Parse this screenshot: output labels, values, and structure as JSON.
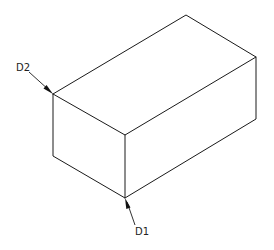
{
  "diagram": {
    "type": "isometric-box",
    "stroke_color": "#1a1a1a",
    "background": "#ffffff",
    "vertices": {
      "top_left": [
        53,
        94
      ],
      "top_back": [
        186,
        15
      ],
      "top_right": [
        256,
        57
      ],
      "front_top": [
        125,
        135
      ],
      "bottom_left": [
        53,
        156
      ],
      "bottom_front": [
        125,
        198
      ],
      "bottom_right": [
        256,
        119
      ]
    },
    "labels": [
      {
        "id": "D2",
        "text": "D2",
        "x": 16,
        "y": 63,
        "points_to": "top_left"
      },
      {
        "id": "D1",
        "text": "D1",
        "x": 135,
        "y": 227,
        "points_to": "bottom_front"
      }
    ]
  }
}
